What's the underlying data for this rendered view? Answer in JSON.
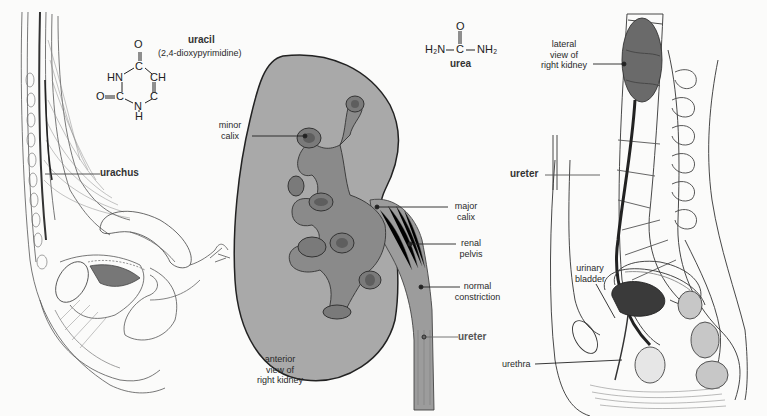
{
  "figure": {
    "panels": [
      {
        "id": "left",
        "subject": "sagittal section showing urachus"
      },
      {
        "id": "center",
        "subject": "anterior view of right kidney"
      },
      {
        "id": "right",
        "subject": "sagittal section of pelvis with lateral view of right kidney"
      }
    ],
    "colors": {
      "kidney_fill": "#a9a9a9",
      "outline": "#222222",
      "background": "#fbfbfa",
      "calix_fill": "#8a8a8a"
    }
  },
  "chemistry": {
    "uracil": {
      "name": "uracil",
      "synonym": "(2,4-dioxypyrimidine)",
      "atoms": {
        "o_top": "O",
        "c4": "C",
        "hn": "HN",
        "ch": "CH",
        "o_left": "O",
        "c2": "C",
        "c6": "C",
        "n": "N",
        "h": "H"
      }
    },
    "urea": {
      "name": "urea",
      "o": "O",
      "left": "H₂N",
      "c": "C",
      "right": "NH₂"
    }
  },
  "labels": {
    "urachus": "urachus",
    "minor_calix": [
      "minor",
      "calix"
    ],
    "major_calix": [
      "major",
      "calix"
    ],
    "renal_pelvis": [
      "renal",
      "pelvis"
    ],
    "normal_constriction": [
      "normal",
      "constriction"
    ],
    "ureter_center": "ureter",
    "anterior_view": [
      "anterior",
      "view of",
      "right kidney"
    ],
    "lateral_view": [
      "lateral",
      "view of",
      "right kidney"
    ],
    "ureter_right": "ureter",
    "urinary_bladder": [
      "urinary",
      "bladder"
    ],
    "urethra": "urethra"
  }
}
